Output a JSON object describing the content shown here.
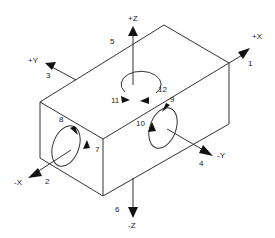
{
  "diagram": {
    "type": "isometric-box-axes",
    "axes": {
      "plus_x": "+X",
      "minus_x": "-X",
      "plus_y": "+Y",
      "minus_y": "-Y",
      "plus_z": "+Z",
      "minus_z": "-Z"
    },
    "numbers": {
      "n1": "1",
      "n2": "2",
      "n3": "3",
      "n4": "4",
      "n5": "5",
      "n6": "6",
      "n7": "7",
      "n8": "8",
      "n9": "9",
      "n10": "10",
      "n11": "11",
      "n12": "12"
    },
    "line_color": "#333333",
    "background": "#ffffff"
  }
}
